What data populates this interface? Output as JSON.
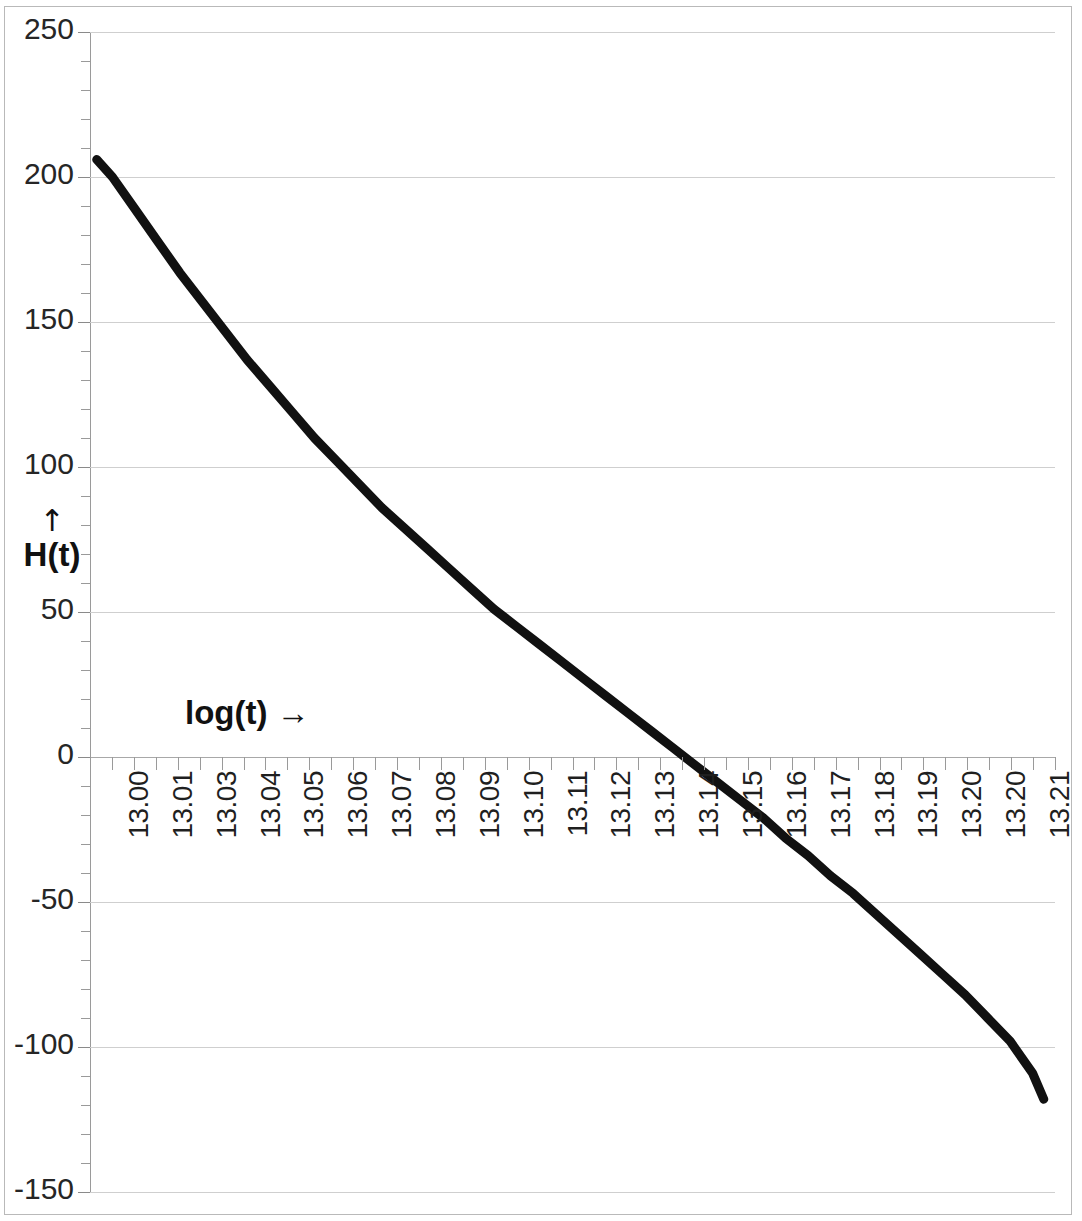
{
  "chart_data": {
    "type": "line",
    "title": "",
    "subtitle": "",
    "xlabel": "log(t)",
    "ylabel": "H(t)",
    "xlabel_display": "log(t) →",
    "ylabel_display": "H(t)",
    "ylabel_arrow": "↑",
    "grid": true,
    "legend": false,
    "legend_position": "none",
    "xlim": [
      13.0,
      13.215
    ],
    "ylim": [
      -150,
      250
    ],
    "y_major_step": 50,
    "y_minor_step": 10,
    "y_ticks": [
      250,
      200,
      150,
      100,
      50,
      0,
      -50,
      -100,
      -150
    ],
    "y_tick_labels": [
      "250",
      "200",
      "150",
      "100",
      "50",
      "0",
      "-50",
      "-100",
      "-150"
    ],
    "x_tick_labels": [
      "13.00",
      "13.01",
      "13.03",
      "13.04",
      "13.05",
      "13.06",
      "13.07",
      "13.08",
      "13.09",
      "13.10",
      "13.11",
      "13.12",
      "13.13",
      "13.14",
      "13.15",
      "13.16",
      "13.17",
      "13.18",
      "13.19",
      "13.20",
      "13.20",
      "13.21"
    ],
    "x_minor_ticks_per_label": 2,
    "series": [
      {
        "name": "H(t)",
        "color": "#111111",
        "line_width": 9,
        "x": [
          13.0015,
          13.005,
          13.01,
          13.015,
          13.02,
          13.025,
          13.03,
          13.035,
          13.04,
          13.045,
          13.05,
          13.055,
          13.06,
          13.065,
          13.07,
          13.075,
          13.08,
          13.085,
          13.09,
          13.095,
          13.1,
          13.105,
          13.11,
          13.115,
          13.12,
          13.125,
          13.13,
          13.135,
          13.14,
          13.145,
          13.15,
          13.155,
          13.16,
          13.165,
          13.17,
          13.175,
          13.18,
          13.185,
          13.19,
          13.195,
          13.2,
          13.205,
          13.21,
          13.2125
        ],
        "y": [
          206,
          200,
          189,
          178,
          167,
          157,
          147,
          137,
          128,
          119,
          110,
          102,
          94,
          86,
          79,
          72,
          65,
          58,
          51,
          45,
          39,
          33,
          27,
          21,
          15,
          9,
          3,
          -3,
          -9,
          -15,
          -21,
          -28,
          -34,
          -41,
          -47,
          -54,
          -61,
          -68,
          -75,
          -82,
          -90,
          -98,
          -109,
          -118
        ]
      }
    ],
    "annotations": []
  }
}
